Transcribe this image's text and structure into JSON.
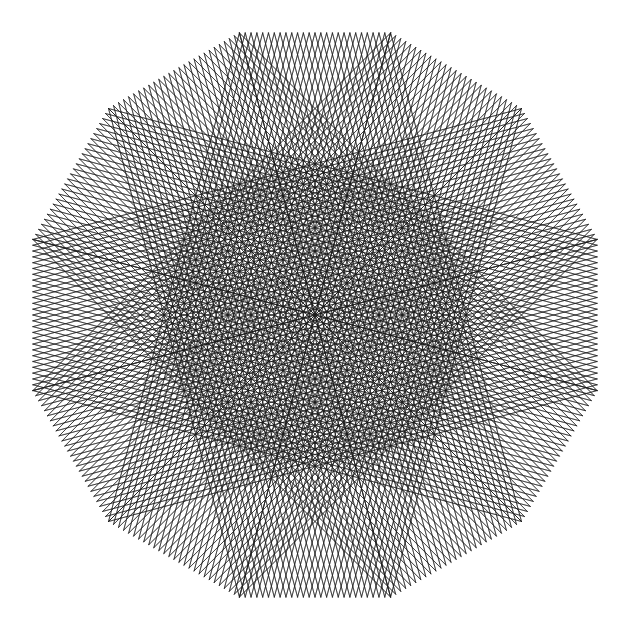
{
  "canvas": {
    "width": 630,
    "height": 630,
    "background_color": "#ffffff"
  },
  "artwork": {
    "name": "string-art-dodecagon-rosette",
    "description": "Monochrome geometric string-art rosette: twelve straight-line bundles woven around a regular 12-sided polygon, forming a hexagonal central void, twelve lens-shaped outer voids and pointed cusp spikes.",
    "center_x": 315,
    "center_y": 315,
    "outer_radius": 292,
    "sides": 12,
    "rotation_deg": 15,
    "skip": 5,
    "lines_per_bundle": 26,
    "stroke_color": "#1a1a1a",
    "stroke_width": 0.62,
    "stroke_opacity": 0.92,
    "fill": "none"
  },
  "chart_data": {
    "type": "line",
    "title": "",
    "subtitle": "",
    "xlabel": "",
    "ylabel": "",
    "grid": false,
    "legend_position": "none",
    "xlim": [
      32,
      598
    ],
    "ylim": [
      28,
      602
    ],
    "geometry": {
      "shape": "regular polygon string art",
      "polygon_sides": 12,
      "polygon_center": [
        315,
        315
      ],
      "polygon_circumradius": 292,
      "polygon_start_angle_deg": 15,
      "chord_skip": 5,
      "subdivisions_per_edge": 26,
      "total_line_count": 312,
      "inner_void_shape": "hexagon",
      "inner_void_radius": 118,
      "outer_void_count": 12,
      "cusp_spike_count": 12
    },
    "vertices": [
      [
        597.1,
        390.6
      ],
      [
        535.0,
        491.0
      ],
      [
        441.6,
        561.8
      ],
      [
        315.0,
        607.0
      ],
      [
        188.4,
        561.8
      ],
      [
        95.0,
        491.0
      ],
      [
        32.9,
        390.6
      ],
      [
        32.9,
        239.4
      ],
      [
        95.0,
        139.0
      ],
      [
        188.4,
        68.2
      ],
      [
        315.0,
        23.0
      ],
      [
        441.6,
        68.2
      ],
      [
        535.0,
        139.0
      ],
      [
        597.1,
        239.4
      ]
    ],
    "series": [
      {
        "name": "bundle-family-a",
        "values": [
          26,
          26,
          26,
          26,
          26,
          26,
          26,
          26,
          26,
          26,
          26,
          26
        ]
      },
      {
        "name": "bundle-family-b",
        "values": [
          26,
          26,
          26,
          26,
          26,
          26,
          26,
          26,
          26,
          26,
          26,
          26
        ]
      }
    ]
  }
}
